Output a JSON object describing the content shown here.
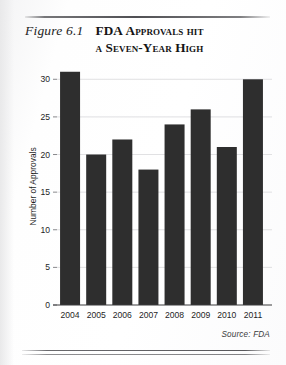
{
  "figure": {
    "number_label": "Figure 6.1",
    "title_lead": "FDA",
    "title_rest_line1": "Approvals hit",
    "title_line2": "a Seven-Year High",
    "title_full": "FDA Approvals hit a Seven-Year High"
  },
  "source_note": "Source: FDA",
  "chart_data": {
    "type": "bar",
    "title": "FDA Approvals hit a Seven-Year High",
    "categories": [
      "2004",
      "2005",
      "2006",
      "2007",
      "2008",
      "2009",
      "2010",
      "2011"
    ],
    "values": [
      31,
      20,
      22,
      18,
      24,
      26,
      21,
      30
    ],
    "xlabel": "",
    "ylabel": "Number of Approvals",
    "ylim": [
      0,
      31.5
    ],
    "yticks": [
      0,
      5,
      10,
      15,
      20,
      25,
      30
    ],
    "ytick_labels": [
      "0",
      "5",
      "10",
      "15",
      "20",
      "25",
      "30"
    ],
    "grid": true,
    "legend": false,
    "bar_color": "#2e2e2e",
    "gridline_color": "#d8d8da",
    "axis_color": "#3a3a3c",
    "source": "Source: FDA"
  }
}
